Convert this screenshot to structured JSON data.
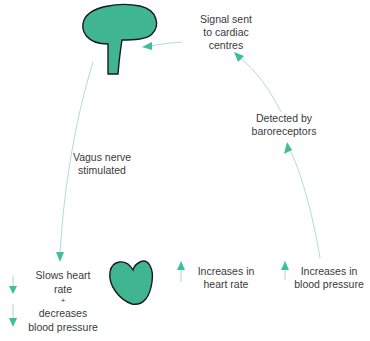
{
  "colors": {
    "accent": "#3dbf9a",
    "fill": "#40b592",
    "outline": "#1a1a1a",
    "line": "#a8d8cc",
    "text": "#3a3a3a"
  },
  "nodes": {
    "brain_label": "Signal sent\nto cardiac\ncentres",
    "detected": "Detected by\nbaroreceptors",
    "vagus": "Vagus nerve\nstimulated",
    "slows": "Slows heart\nrate\n+\ndecreases\nblood pressure",
    "inc_hr": "Increases in\nheart rate",
    "inc_bp": "Increases in\nblood pressure"
  },
  "labels": {
    "signal_1": "Signal sent",
    "signal_2": "to cardiac",
    "signal_3": "centres",
    "detected_1": "Detected by",
    "detected_2": "baroreceptors",
    "vagus_1": "Vagus nerve",
    "vagus_2": "stimulated",
    "slows_1": "Slows heart",
    "slows_2": "rate",
    "slows_3": "+",
    "slows_4": "decreases",
    "slows_5": "blood pressure",
    "inc_hr_1": "Increases in",
    "inc_hr_2": "heart rate",
    "inc_bp_1": "Increases in",
    "inc_bp_2": "blood pressure"
  }
}
